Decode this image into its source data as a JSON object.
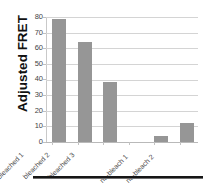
{
  "chart_data": {
    "type": "bar",
    "title": "",
    "xlabel": "",
    "ylabel": "Adjusted FRET",
    "categories": [
      "bleached 1",
      "bleached 2",
      "bleached 3",
      "",
      "no-bleach 1",
      "no-bleach 2"
    ],
    "values": [
      79,
      64,
      38.5,
      0,
      4,
      12
    ],
    "ylim": [
      0,
      80
    ],
    "ytick_labels": [
      "80",
      "70",
      "60",
      "50",
      "40",
      "30",
      "20",
      "10",
      "0"
    ],
    "ytick_values": [
      80,
      70,
      60,
      50,
      40,
      30,
      20,
      10,
      0
    ],
    "grid": "horizontal",
    "legend": "none",
    "bar_color": "#969696",
    "gridline_color": "#d4d4d4",
    "series": [
      {
        "name": "Adjusted FRET",
        "values": [
          79,
          64,
          38.5,
          0,
          4,
          12
        ]
      }
    ]
  },
  "axes": {
    "y_title": "Adjusted FRET",
    "y_ticks": [
      {
        "label": "80",
        "value": 80
      },
      {
        "label": "70",
        "value": 70
      },
      {
        "label": "60",
        "value": 60
      },
      {
        "label": "50",
        "value": 50
      },
      {
        "label": "40",
        "value": 40
      },
      {
        "label": "30",
        "value": 30
      },
      {
        "label": "20",
        "value": 20
      },
      {
        "label": "10",
        "value": 10
      },
      {
        "label": "0",
        "value": 0
      }
    ],
    "x_categories": [
      {
        "label": "bleached 1",
        "value": 79
      },
      {
        "label": "bleached 2",
        "value": 64
      },
      {
        "label": "bleached 3",
        "value": 38.5
      },
      {
        "label": "",
        "value": 0
      },
      {
        "label": "no-bleach 1",
        "value": 4
      },
      {
        "label": "no-bleach 2",
        "value": 12
      }
    ]
  }
}
